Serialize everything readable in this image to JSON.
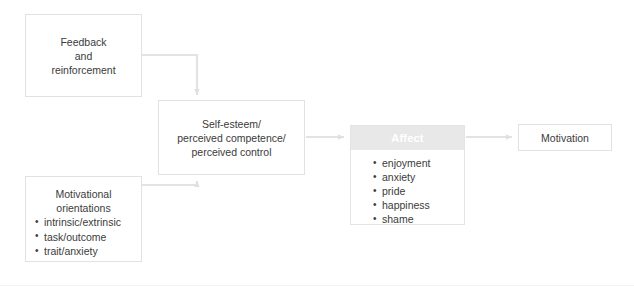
{
  "diagram": {
    "colors": {
      "box_border": "#e2e2e2",
      "box_background": "#ffffff",
      "text": "#3b3b3b",
      "connector": "#e3e3e3",
      "affect_header_background": "#e8e8e8",
      "affect_header_text": "#ffffff"
    },
    "nodes": {
      "feedback": {
        "lines": [
          "Feedback",
          "and",
          "reinforcement"
        ],
        "text": "Feedback\nand\nreinforcement"
      },
      "self_esteem": {
        "lines": [
          "Self-esteem/",
          "perceived competence/",
          "perceived control"
        ],
        "text": "Self-esteem/\nperceived competence/\nperceived control"
      },
      "motivational_orientations": {
        "heading_lines": [
          "Motivational",
          "orientations"
        ],
        "heading": "Motivational\norientations",
        "items": [
          "intrinsic/extrinsic",
          "task/outcome",
          "trait/anxiety"
        ]
      },
      "affect": {
        "header": "Affect",
        "items": [
          "enjoyment",
          "anxiety",
          "pride",
          "happiness",
          "shame"
        ]
      },
      "motivation": {
        "label": "Motivation"
      }
    },
    "connectors": [
      {
        "name": "feedback-to-self-esteem",
        "from": "feedback",
        "to": "self_esteem",
        "style": "elbow-down",
        "arrowhead": "down"
      },
      {
        "name": "motivational-orientations-to-self-esteem",
        "from": "motivational_orientations",
        "to": "self_esteem",
        "style": "elbow-up",
        "arrowhead": "up"
      },
      {
        "name": "self-esteem-to-affect",
        "from": "self_esteem",
        "to": "affect",
        "style": "straight",
        "arrowhead": "right"
      },
      {
        "name": "affect-to-motivation",
        "from": "affect",
        "to": "motivation",
        "style": "straight",
        "arrowhead": "right"
      }
    ]
  }
}
